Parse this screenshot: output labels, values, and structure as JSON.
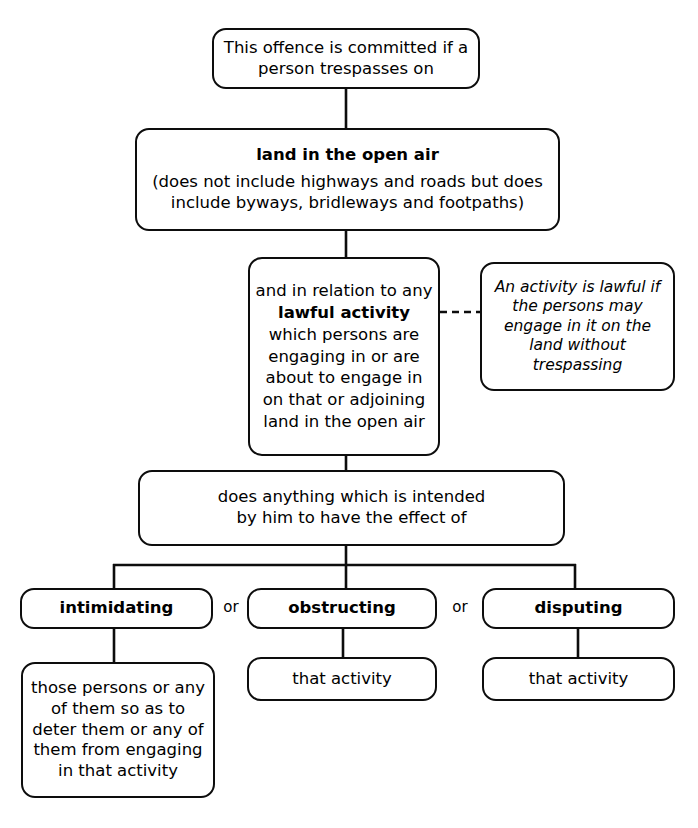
{
  "diagram": {
    "ink_color": "#0d0d0d",
    "background_color": "#ffffff",
    "nodes": {
      "trespass": {
        "lines": [
          {
            "text": "This offence is committed if a",
            "style": "normal"
          },
          {
            "text": "person trespasses on",
            "style": "normal"
          }
        ]
      },
      "land": {
        "lines": [
          {
            "text": "land in the open air",
            "style": "bold"
          },
          {
            "text": "(does not include highways and roads but does",
            "style": "normal"
          },
          {
            "text": "include byways, bridleways and footpaths)",
            "style": "normal"
          }
        ]
      },
      "lawful": {
        "lines": [
          {
            "text": "and in relation to any",
            "style": "normal"
          },
          {
            "text": "lawful activity",
            "style": "bold"
          },
          {
            "text": "which persons are",
            "style": "normal"
          },
          {
            "text": "engaging in or are",
            "style": "normal"
          },
          {
            "text": "about to engage in",
            "style": "normal"
          },
          {
            "text": "on that or adjoining",
            "style": "normal"
          },
          {
            "text": "land in the open air",
            "style": "normal"
          }
        ]
      },
      "definition": {
        "lines": [
          {
            "text": "An activity is lawful if",
            "style": "italic"
          },
          {
            "text": "the persons may",
            "style": "italic"
          },
          {
            "text": "engage in it on the",
            "style": "italic"
          },
          {
            "text": "land without",
            "style": "italic"
          },
          {
            "text": "trespassing",
            "style": "italic"
          }
        ]
      },
      "intent": {
        "lines": [
          {
            "text": "does anything which is intended",
            "style": "normal"
          },
          {
            "text": "by him to have the effect of",
            "style": "normal"
          }
        ]
      },
      "intimidating": {
        "lines": [
          {
            "text": "intimidating",
            "style": "bold"
          }
        ]
      },
      "obstructing": {
        "lines": [
          {
            "text": "obstructing",
            "style": "bold"
          }
        ]
      },
      "disputing": {
        "lines": [
          {
            "text": "disputing",
            "style": "bold"
          }
        ]
      },
      "deter": {
        "lines": [
          {
            "text": "those persons or any",
            "style": "normal"
          },
          {
            "text": "of them so as to",
            "style": "normal"
          },
          {
            "text": "deter them or any of",
            "style": "normal"
          },
          {
            "text": "them from engaging",
            "style": "normal"
          },
          {
            "text": "in that activity",
            "style": "normal"
          }
        ]
      },
      "activity_1": {
        "lines": [
          {
            "text": "that activity",
            "style": "normal"
          }
        ]
      },
      "activity_2": {
        "lines": [
          {
            "text": "that activity",
            "style": "normal"
          }
        ]
      }
    },
    "connector_labels": {
      "or_1": "or",
      "or_2": "or"
    }
  }
}
